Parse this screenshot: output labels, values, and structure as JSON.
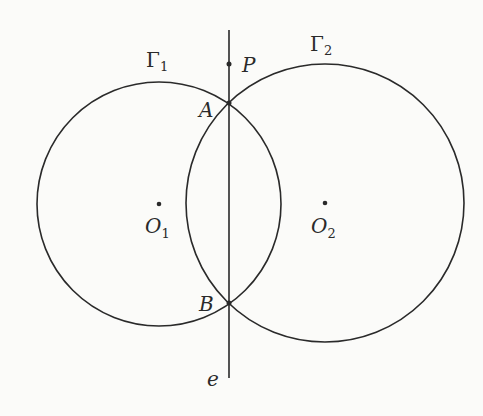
{
  "diagram": {
    "title": "",
    "stroke_color": "#2a2a2a",
    "circles": [
      {
        "id": "gamma1",
        "label": "Γ",
        "subscript": "1",
        "center_label": "O",
        "center_subscript": "1",
        "cx": 159,
        "cy": 204,
        "r": 122
      },
      {
        "id": "gamma2",
        "label": "Γ",
        "subscript": "2",
        "center_label": "O",
        "center_subscript": "2",
        "cx": 325,
        "cy": 203,
        "r": 139
      }
    ],
    "line": {
      "label": "e",
      "x": 229,
      "y1": 30,
      "y2": 378
    },
    "points": [
      {
        "label": "P",
        "x": 229,
        "y": 64
      },
      {
        "label": "A",
        "x": 229,
        "y": 103
      },
      {
        "label": "B",
        "x": 229,
        "y": 303
      }
    ]
  }
}
